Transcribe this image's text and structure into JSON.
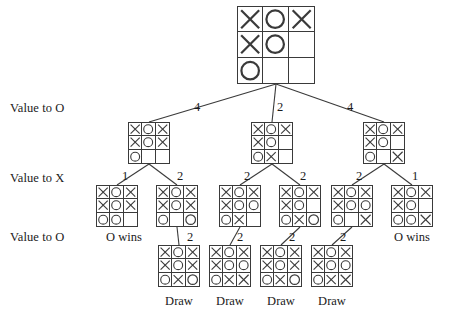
{
  "diagram": {
    "row_labels": [
      {
        "text": "Value to O",
        "x": 10,
        "y": 102
      },
      {
        "text": "Value to X",
        "x": 10,
        "y": 172
      },
      {
        "text": "Value to O",
        "x": 10,
        "y": 231
      }
    ],
    "boards": [
      {
        "id": "root",
        "cells": [
          "X",
          "O",
          "X",
          "X",
          "O",
          "",
          "O",
          "",
          ""
        ],
        "x": 237,
        "y": 6,
        "w": 78,
        "h": 78,
        "cell": 26
      },
      {
        "id": "L1-a",
        "cells": [
          "X",
          "O",
          "X",
          "X",
          "O",
          "X",
          "O",
          "",
          ""
        ],
        "x": 128,
        "y": 122,
        "w": 42,
        "h": 42,
        "cell": 14
      },
      {
        "id": "L1-b",
        "cells": [
          "X",
          "O",
          "X",
          "X",
          "O",
          "",
          "O",
          "X",
          ""
        ],
        "x": 251,
        "y": 122,
        "w": 42,
        "h": 42,
        "cell": 14
      },
      {
        "id": "L1-c",
        "cells": [
          "X",
          "O",
          "X",
          "X",
          "O",
          "",
          "O",
          "",
          "X"
        ],
        "x": 363,
        "y": 122,
        "w": 42,
        "h": 42,
        "cell": 14
      },
      {
        "id": "L2-a",
        "cells": [
          "X",
          "O",
          "X",
          "X",
          "O",
          "X",
          "O",
          "O",
          ""
        ],
        "x": 96,
        "y": 185,
        "w": 42,
        "h": 42,
        "cell": 14
      },
      {
        "id": "L2-b",
        "cells": [
          "X",
          "O",
          "X",
          "X",
          "O",
          "X",
          "O",
          "",
          "O"
        ],
        "x": 156,
        "y": 185,
        "w": 42,
        "h": 42,
        "cell": 14
      },
      {
        "id": "L2-c",
        "cells": [
          "X",
          "O",
          "X",
          "X",
          "O",
          "O",
          "O",
          "X",
          ""
        ],
        "x": 219,
        "y": 185,
        "w": 42,
        "h": 42,
        "cell": 14
      },
      {
        "id": "L2-d",
        "cells": [
          "X",
          "O",
          "X",
          "X",
          "O",
          "",
          "O",
          "X",
          "O"
        ],
        "x": 279,
        "y": 185,
        "w": 42,
        "h": 42,
        "cell": 14
      },
      {
        "id": "L2-e",
        "cells": [
          "X",
          "O",
          "X",
          "X",
          "O",
          "O",
          "O",
          "",
          "X"
        ],
        "x": 331,
        "y": 185,
        "w": 42,
        "h": 42,
        "cell": 14
      },
      {
        "id": "L2-f",
        "cells": [
          "X",
          "O",
          "X",
          "X",
          "O",
          "",
          "O",
          "O",
          "X"
        ],
        "x": 391,
        "y": 185,
        "w": 42,
        "h": 42,
        "cell": 14
      },
      {
        "id": "L3-a",
        "cells": [
          "X",
          "O",
          "X",
          "X",
          "O",
          "X",
          "O",
          "X",
          "O"
        ],
        "x": 158,
        "y": 245,
        "w": 42,
        "h": 42,
        "cell": 14
      },
      {
        "id": "L3-b",
        "cells": [
          "X",
          "O",
          "X",
          "X",
          "O",
          "O",
          "O",
          "X",
          "X"
        ],
        "x": 209,
        "y": 245,
        "w": 42,
        "h": 42,
        "cell": 14
      },
      {
        "id": "L3-c",
        "cells": [
          "X",
          "O",
          "X",
          "X",
          "O",
          "X",
          "O",
          "X",
          "O"
        ],
        "x": 260,
        "y": 245,
        "w": 42,
        "h": 42,
        "cell": 14
      },
      {
        "id": "L3-d",
        "cells": [
          "X",
          "O",
          "X",
          "X",
          "O",
          "O",
          "O",
          "X",
          "X"
        ],
        "x": 311,
        "y": 245,
        "w": 42,
        "h": 42,
        "cell": 14
      }
    ],
    "edges": [
      {
        "x1": 276,
        "y1": 84,
        "x2": 149,
        "y2": 122
      },
      {
        "x1": 276,
        "y1": 84,
        "x2": 272,
        "y2": 122
      },
      {
        "x1": 276,
        "y1": 84,
        "x2": 384,
        "y2": 122
      },
      {
        "x1": 149,
        "y1": 164,
        "x2": 117,
        "y2": 185
      },
      {
        "x1": 149,
        "y1": 164,
        "x2": 177,
        "y2": 185
      },
      {
        "x1": 272,
        "y1": 164,
        "x2": 240,
        "y2": 185
      },
      {
        "x1": 272,
        "y1": 164,
        "x2": 300,
        "y2": 185
      },
      {
        "x1": 384,
        "y1": 164,
        "x2": 352,
        "y2": 185
      },
      {
        "x1": 384,
        "y1": 164,
        "x2": 412,
        "y2": 185
      },
      {
        "x1": 177,
        "y1": 227,
        "x2": 179,
        "y2": 245
      },
      {
        "x1": 240,
        "y1": 227,
        "x2": 230,
        "y2": 245
      },
      {
        "x1": 300,
        "y1": 227,
        "x2": 281,
        "y2": 245
      },
      {
        "x1": 352,
        "y1": 227,
        "x2": 332,
        "y2": 245
      }
    ],
    "edge_labels": [
      {
        "value": "4",
        "x": 197,
        "y": 101
      },
      {
        "value": "2",
        "x": 280,
        "y": 101
      },
      {
        "value": "4",
        "x": 350,
        "y": 101
      },
      {
        "value": "1",
        "x": 125,
        "y": 170
      },
      {
        "value": "2",
        "x": 180,
        "y": 170
      },
      {
        "value": "2",
        "x": 247,
        "y": 170
      },
      {
        "value": "2",
        "x": 303,
        "y": 170
      },
      {
        "value": "2",
        "x": 359,
        "y": 170
      },
      {
        "value": "1",
        "x": 415,
        "y": 170
      },
      {
        "value": "2",
        "x": 190,
        "y": 231
      },
      {
        "value": "2",
        "x": 240,
        "y": 231
      },
      {
        "value": "2",
        "x": 292,
        "y": 231
      },
      {
        "value": "2",
        "x": 343,
        "y": 231
      }
    ],
    "terminal_labels": [
      {
        "text": "O wins",
        "x": 124,
        "y": 231
      },
      {
        "text": "O wins",
        "x": 412,
        "y": 231
      },
      {
        "text": "Draw",
        "x": 179,
        "y": 295
      },
      {
        "text": "Draw",
        "x": 230,
        "y": 295
      },
      {
        "text": "Draw",
        "x": 281,
        "y": 295
      },
      {
        "text": "Draw",
        "x": 332,
        "y": 295
      }
    ],
    "colors": {
      "line": "#3a3a3a",
      "text": "#1a1a1a",
      "background": "#ffffff"
    }
  }
}
